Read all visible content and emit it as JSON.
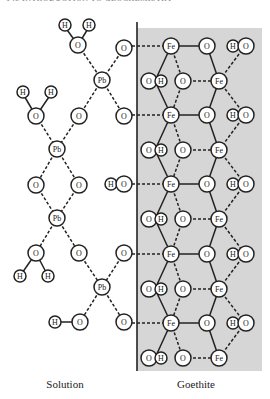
{
  "header": {
    "text": "148   INTRODUCTION TO GEOCHEMISTRY"
  },
  "labels": {
    "solution": "Solution",
    "goethite": "Goethite"
  },
  "colors": {
    "goethite_fill": "#d6d6d6",
    "atom_fill": "#ffffff",
    "stroke": "#222222"
  },
  "atoms": {
    "H": "H",
    "O": "O",
    "Pb": "Pb",
    "Fe": "Fe"
  }
}
